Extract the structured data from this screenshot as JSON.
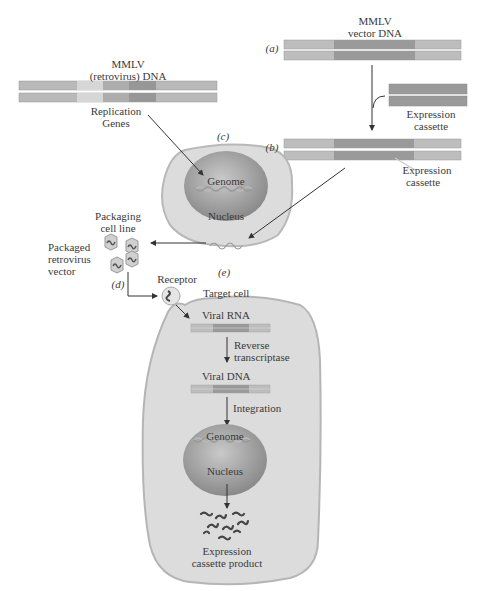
{
  "figure": {
    "colors": {
      "dna_light": "#b9b9b9",
      "dna_mid": "#a3a3a3",
      "dna_dark": "#8f8f8f",
      "dna_pale": "#d6d6d6",
      "cell_fill": "#dcdcdc",
      "cell_stroke": "#b5b5b5",
      "nucleus": "#9e9e9e",
      "arrow": "#333333"
    },
    "panels": {
      "a": "(a)",
      "b": "(b)",
      "c": "(c)",
      "d": "(d)",
      "e": "(e)"
    },
    "labels": {
      "mmlv_retrovirus_dna_line1": "MMLV",
      "mmlv_retrovirus_dna_line2": "(retrovirus) DNA",
      "replication_genes_line1": "Replication",
      "replication_genes_line2": "Genes",
      "mmlv_vector_dna_line1": "MMLV",
      "mmlv_vector_dna_line2": "vector DNA",
      "expression_cassette_top_line1": "Expression",
      "expression_cassette_top_line2": "cassette",
      "expression_cassette_b_line1": "Expression",
      "expression_cassette_b_line2": "cassette",
      "genome_c": "Genome",
      "nucleus_c": "Nucleus",
      "packaging_cell_line_line1": "Packaging",
      "packaging_cell_line_line2": "cell line",
      "packaged_vector_line1": "Packaged",
      "packaged_vector_line2": "retrovirus",
      "packaged_vector_line3": "vector",
      "receptor": "Receptor",
      "target_cell": "Target cell",
      "viral_rna": "Viral RNA",
      "reverse_transcriptase_line1": "Reverse",
      "reverse_transcriptase_line2": "transcriptase",
      "viral_dna": "Viral DNA",
      "integration": "Integration",
      "genome_e": "Genome",
      "nucleus_e": "Nucleus",
      "product_line1": "Expression",
      "product_line2": "cassette product"
    }
  }
}
